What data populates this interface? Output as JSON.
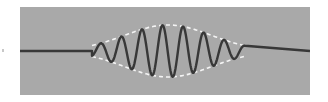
{
  "diagram": {
    "type": "wave-packet",
    "colors": {
      "page_background": "#ffffff",
      "panel_background": "#a9a9a9",
      "wave": "#383838",
      "envelope": "#f4f4f4"
    },
    "panel": {
      "x": 20,
      "y": 7,
      "width": 290,
      "height": 88
    },
    "baseline_y": 51,
    "packet": {
      "center_x": 168,
      "start_x": 92,
      "end_x": 245,
      "amplitude_px": 26,
      "wavelength_px": 20.6,
      "sigma_px": 32
    }
  }
}
